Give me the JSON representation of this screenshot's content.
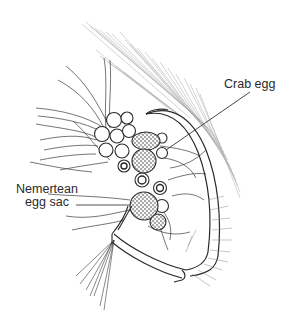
{
  "figure": {
    "labels": {
      "crab_egg": "Crab egg",
      "nemertean_line1": "Nemertean",
      "nemertean_line2": "egg sac"
    },
    "colors": {
      "background": "#ffffff",
      "ink": "#2a2a2a",
      "leader_line": "#555555",
      "fine_setae": "#9a9a9a"
    }
  }
}
